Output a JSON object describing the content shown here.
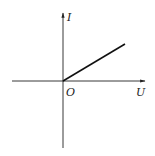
{
  "diagram": {
    "type": "I-U characteristic graph",
    "x_axis": {
      "label": "U"
    },
    "y_axis": {
      "label": "I"
    },
    "origin_label": "O",
    "line": {
      "description": "straight line from origin into first quadrant"
    }
  },
  "colors": {
    "stroke": "#222222",
    "background": "#ffffff"
  }
}
